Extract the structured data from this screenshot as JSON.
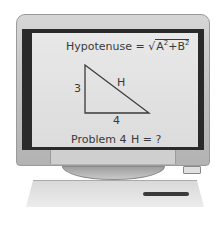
{
  "screen": {
    "formula": {
      "label": "Hypotenuse =",
      "radical": "√",
      "a": "A",
      "a_exp": "2",
      "plus": "+",
      "b": "B",
      "b_exp": "2"
    },
    "triangle": {
      "side_vertical": "3",
      "side_horizontal": "4",
      "hypotenuse": "H"
    },
    "problem_label": "Problem 4",
    "question": "H = ?"
  }
}
